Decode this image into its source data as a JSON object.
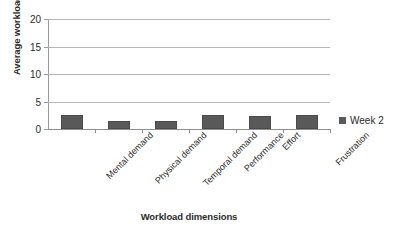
{
  "chart_data": {
    "type": "bar",
    "title": "",
    "xlabel": "Workload dimensions",
    "ylabel": "Average workload rating",
    "categories": [
      "Mental demand",
      "Physical demand",
      "Temporal demand",
      "Performance",
      "Effort",
      "Frustration"
    ],
    "series": [
      {
        "name": "Week 2",
        "color": "#595959",
        "values": [
          2.5,
          1.5,
          1.5,
          2.5,
          2.4,
          2.5
        ]
      }
    ],
    "ylim": [
      0,
      20
    ],
    "yticks": [
      0,
      5,
      10,
      15,
      20
    ],
    "ytick_labels": [
      "0",
      "5",
      "10",
      "15",
      "20"
    ],
    "grid": "horizontal",
    "legend_position": "right",
    "legend_entries": [
      "Week 2"
    ]
  },
  "axes": {
    "y_title": "Average workload rating",
    "x_title": "Workload dimensions"
  },
  "legend": {
    "items": [
      {
        "label": "Week 2",
        "color": "#595959"
      }
    ]
  },
  "colors": {
    "bar": "#595959",
    "gridline": "#b7b7b7",
    "axis": "#8f8f8f",
    "text": "#2b2b2b",
    "background": "#ffffff"
  }
}
